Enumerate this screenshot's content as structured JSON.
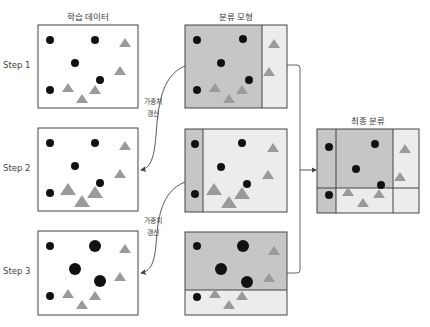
{
  "titles": {
    "training_data": "학습 데이터",
    "classifier": "분류 모형",
    "final": "최종 분류"
  },
  "steps": [
    "Step 1",
    "Step 2",
    "Step 3"
  ],
  "weight_update_label": [
    "가중치",
    "갱신"
  ],
  "colors": {
    "circle": "#111111",
    "triangle": "#9a9a9a",
    "dark_region": "#c6c6c6",
    "light_region": "#ececec",
    "border": "#444444",
    "line": "#555555"
  }
}
